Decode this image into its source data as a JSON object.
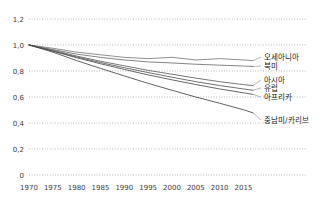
{
  "chart_data": {
    "type": "line",
    "title": "",
    "subtitle": "",
    "xlabel": "",
    "ylabel": "",
    "xlim": [
      1970,
      2017
    ],
    "ylim": [
      0,
      1.2
    ],
    "grid": true,
    "legend_position": "right-inline-labels",
    "x_ticks": [
      "1970",
      "1975",
      "1980",
      "1985",
      "1990",
      "1995",
      "2000",
      "2005",
      "2010",
      "2015"
    ],
    "x_tick_values": [
      1970,
      1975,
      1980,
      1985,
      1990,
      1995,
      2000,
      2005,
      2010,
      2015
    ],
    "y_ticks": [
      "0",
      "0,2",
      "0,4",
      "0,6",
      "0,8",
      "1,0",
      "1,2"
    ],
    "y_tick_values": [
      0,
      0.2,
      0.4,
      0.6,
      0.8,
      1.0,
      1.2
    ],
    "x": [
      1970,
      1975,
      1980,
      1985,
      1990,
      1995,
      2000,
      2005,
      2010,
      2015,
      2017
    ],
    "series": [
      {
        "name": "오세아니아",
        "color": "#7a7a7a",
        "values": [
          1.0,
          0.975,
          0.945,
          0.925,
          0.905,
          0.895,
          0.905,
          0.885,
          0.895,
          0.885,
          0.88
        ]
      },
      {
        "name": "북미",
        "color": "#6e6e6e",
        "values": [
          1.0,
          0.965,
          0.93,
          0.905,
          0.885,
          0.87,
          0.862,
          0.852,
          0.845,
          0.838,
          0.835
        ]
      },
      {
        "name": "아시아",
        "color": "#5f5f5f",
        "values": [
          1.0,
          0.96,
          0.915,
          0.875,
          0.84,
          0.805,
          0.775,
          0.745,
          0.718,
          0.695,
          0.688
        ]
      },
      {
        "name": "유럽",
        "color": "#565656",
        "values": [
          1.0,
          0.955,
          0.908,
          0.865,
          0.825,
          0.788,
          0.752,
          0.718,
          0.688,
          0.662,
          0.652
        ]
      },
      {
        "name": "아프리카",
        "color": "#4d4d4d",
        "values": [
          1.0,
          0.952,
          0.902,
          0.856,
          0.812,
          0.77,
          0.732,
          0.696,
          0.662,
          0.632,
          0.62
        ]
      },
      {
        "name": "중남미/카리브",
        "color": "#474747",
        "values": [
          1.0,
          0.945,
          0.88,
          0.82,
          0.762,
          0.705,
          0.652,
          0.6,
          0.552,
          0.502,
          0.478
        ]
      }
    ],
    "series_labels": [
      {
        "text": "오세아니아",
        "y_value": 0.88
      },
      {
        "text": "북미",
        "y_value": 0.835
      },
      {
        "text": "아시아",
        "y_value": 0.688
      },
      {
        "text": "유럽",
        "y_value": 0.652
      },
      {
        "text": "아프리카",
        "y_value": 0.62
      },
      {
        "text": "중남미/카리브",
        "y_value": 0.478
      }
    ]
  }
}
